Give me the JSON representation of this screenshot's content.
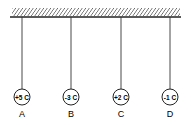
{
  "diagram": {
    "type": "suspended-charged-spheres",
    "ceiling": {
      "hatched": true
    },
    "spheres": [
      {
        "label": "A",
        "charge": "+5 C"
      },
      {
        "label": "B",
        "charge": "-3 C"
      },
      {
        "label": "C",
        "charge": "+2 C"
      },
      {
        "label": "D",
        "charge": "-1 C"
      }
    ]
  },
  "colors": {
    "ink": "#222222",
    "background": "#ffffff"
  }
}
